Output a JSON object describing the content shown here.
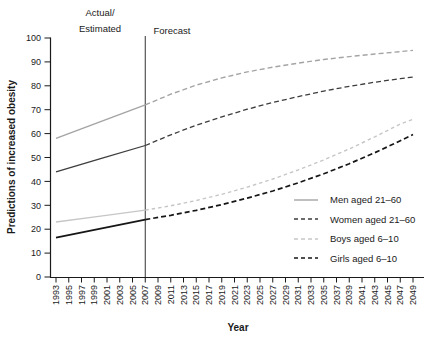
{
  "chart_data": {
    "type": "line",
    "title": "",
    "xlabel": "Year",
    "ylabel": "Predictions of increased obesity",
    "ylim": [
      0,
      100
    ],
    "xlim": [
      1993,
      2049
    ],
    "grid": false,
    "legend_position": "lower-right-inside",
    "y_ticks": [
      0,
      10,
      20,
      30,
      40,
      50,
      60,
      70,
      80,
      90,
      100
    ],
    "x_ticks": [
      1993,
      1995,
      1997,
      1999,
      2001,
      2003,
      2005,
      2007,
      2009,
      2011,
      2013,
      2015,
      2017,
      2019,
      2021,
      2023,
      2025,
      2027,
      2029,
      2031,
      2033,
      2035,
      2037,
      2039,
      2041,
      2043,
      2045,
      2047,
      2049
    ],
    "divider_year": 2007,
    "annotations": {
      "actual_line1": "Actual/",
      "actual_line2": "Estimated",
      "forecast": "Forecast"
    },
    "colors": {
      "axis": "#1a1a1a",
      "divider": "#333333"
    },
    "series": [
      {
        "name": "Men aged 21–60",
        "color": "#a4a4a4",
        "width": 1.4,
        "dash": "5 3",
        "legend_style": "solid",
        "actual": [
          [
            1993,
            58
          ],
          [
            2000,
            65
          ],
          [
            2007,
            72
          ]
        ],
        "forecast": [
          [
            2007,
            72
          ],
          [
            2011,
            76.5
          ],
          [
            2015,
            80.3
          ],
          [
            2019,
            83.3
          ],
          [
            2023,
            85.8
          ],
          [
            2027,
            87.8
          ],
          [
            2031,
            89.5
          ],
          [
            2035,
            91
          ],
          [
            2039,
            92.2
          ],
          [
            2043,
            93.3
          ],
          [
            2047,
            94.3
          ],
          [
            2049,
            94.8
          ]
        ]
      },
      {
        "name": "Women aged 21–60",
        "color": "#3d3d3d",
        "width": 1.3,
        "dash": "5 3",
        "legend_style": "dashed",
        "actual": [
          [
            1993,
            44
          ],
          [
            2000,
            49.5
          ],
          [
            2007,
            55
          ]
        ],
        "forecast": [
          [
            2007,
            55
          ],
          [
            2011,
            59.5
          ],
          [
            2015,
            63.5
          ],
          [
            2019,
            67
          ],
          [
            2023,
            70.2
          ],
          [
            2027,
            73
          ],
          [
            2031,
            75.5
          ],
          [
            2035,
            77.8
          ],
          [
            2039,
            79.8
          ],
          [
            2043,
            81.5
          ],
          [
            2047,
            83
          ],
          [
            2049,
            83.7
          ]
        ]
      },
      {
        "name": "Boys aged 6–10",
        "color": "#c6c6c6",
        "width": 1.4,
        "dash": "3.5 3",
        "legend_style": "dashed",
        "actual": [
          [
            1993,
            23
          ],
          [
            2000,
            25.5
          ],
          [
            2007,
            28
          ]
        ],
        "forecast": [
          [
            2007,
            28
          ],
          [
            2011,
            29.8
          ],
          [
            2015,
            32
          ],
          [
            2019,
            34.6
          ],
          [
            2023,
            37.6
          ],
          [
            2027,
            41
          ],
          [
            2031,
            44.8
          ],
          [
            2035,
            49
          ],
          [
            2039,
            53.6
          ],
          [
            2043,
            58.6
          ],
          [
            2047,
            64
          ],
          [
            2049,
            66
          ]
        ]
      },
      {
        "name": "Girls aged 6–10",
        "color": "#161616",
        "width": 1.7,
        "dash": "5 3",
        "legend_style": "dashed",
        "actual": [
          [
            1993,
            16.5
          ],
          [
            2000,
            20.2
          ],
          [
            2007,
            24
          ]
        ],
        "forecast": [
          [
            2007,
            24
          ],
          [
            2011,
            25.8
          ],
          [
            2015,
            27.9
          ],
          [
            2019,
            30.3
          ],
          [
            2023,
            33
          ],
          [
            2027,
            36
          ],
          [
            2031,
            39.4
          ],
          [
            2035,
            43.2
          ],
          [
            2039,
            47.4
          ],
          [
            2043,
            52
          ],
          [
            2047,
            57
          ],
          [
            2049,
            59.6
          ]
        ]
      }
    ]
  }
}
